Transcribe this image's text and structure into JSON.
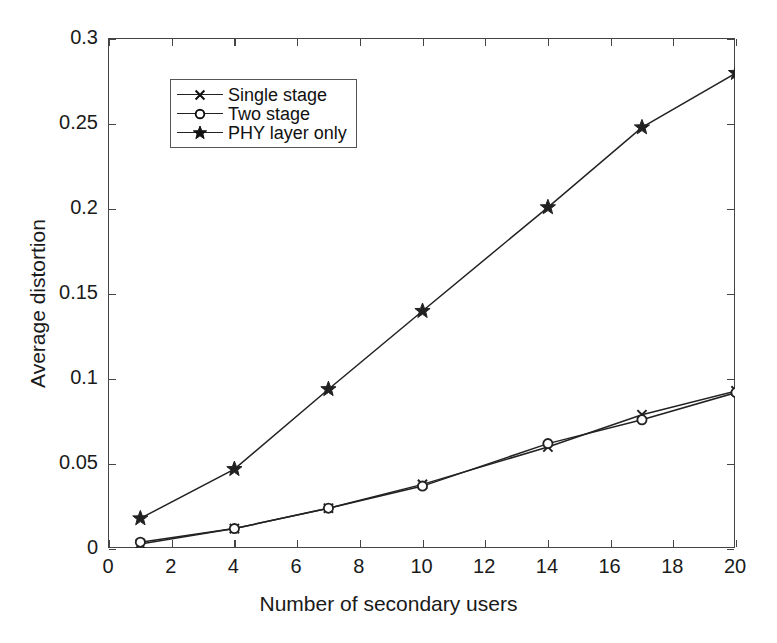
{
  "chart_data": {
    "type": "line",
    "title": "",
    "xlabel": "Number of secondary users",
    "ylabel": "Average distortion",
    "xlim": [
      0,
      20
    ],
    "ylim": [
      0,
      0.3
    ],
    "xticks": [
      0,
      2,
      4,
      6,
      8,
      10,
      12,
      14,
      16,
      18,
      20
    ],
    "xtick_labels": [
      "0",
      "2",
      "4",
      "6",
      "8",
      "10",
      "12",
      "14",
      "16",
      "18",
      "20"
    ],
    "yticks": [
      0,
      0.05,
      0.1,
      0.15,
      0.2,
      0.25,
      0.3
    ],
    "ytick_labels": [
      "0",
      "0.05",
      "0.1",
      "0.15",
      "0.2",
      "0.25",
      "0.3"
    ],
    "grid": false,
    "legend_position": "upper left",
    "x": [
      1,
      4,
      7,
      10,
      14,
      17,
      20
    ],
    "series": [
      {
        "name": "Single stage",
        "marker": "x",
        "values": [
          0.003,
          0.012,
          0.024,
          0.038,
          0.06,
          0.079,
          0.093
        ]
      },
      {
        "name": "Two stage",
        "marker": "o",
        "values": [
          0.004,
          0.012,
          0.024,
          0.037,
          0.062,
          0.076,
          0.092
        ]
      },
      {
        "name": "PHY layer only",
        "marker": "star",
        "values": [
          0.018,
          0.047,
          0.094,
          0.14,
          0.201,
          0.248,
          0.28
        ]
      }
    ],
    "line_color": "#222222",
    "axis_color": "#444444",
    "background": "#ffffff"
  },
  "legend": {
    "items": [
      {
        "label": "Single stage",
        "marker": "x-marker"
      },
      {
        "label": "Two stage",
        "marker": "circle-marker"
      },
      {
        "label": "PHY layer only",
        "marker": "star-marker"
      }
    ]
  }
}
